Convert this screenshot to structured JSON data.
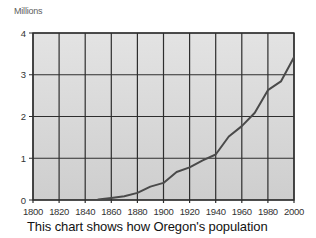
{
  "chart_data": {
    "type": "line",
    "title": "",
    "unit_label": "Millions",
    "caption": "This chart shows how Oregon's population",
    "x": [
      1850,
      1860,
      1870,
      1880,
      1890,
      1900,
      1910,
      1920,
      1930,
      1940,
      1950,
      1960,
      1970,
      1980,
      1990,
      2000
    ],
    "values": [
      0.01,
      0.05,
      0.09,
      0.17,
      0.32,
      0.41,
      0.67,
      0.78,
      0.95,
      1.09,
      1.52,
      1.77,
      2.09,
      2.63,
      2.84,
      3.42
    ],
    "x_ticks": [
      1800,
      1820,
      1840,
      1860,
      1880,
      1900,
      1920,
      1940,
      1960,
      1980,
      2000
    ],
    "y_ticks": [
      0,
      1,
      2,
      3,
      4
    ],
    "xlim": [
      1800,
      2000
    ],
    "ylim": [
      0,
      4
    ],
    "grid": true,
    "legend": "none",
    "colors": {
      "plot_bg_top": "#e3e3e3",
      "plot_bg_bottom": "#cecece",
      "grid": "#2e2e2e",
      "line": "#4a4a4a",
      "tick_text": "#333333",
      "unit_text": "#5e5e5e",
      "caption_text": "#121212",
      "page_bg": "#ffffff"
    }
  }
}
